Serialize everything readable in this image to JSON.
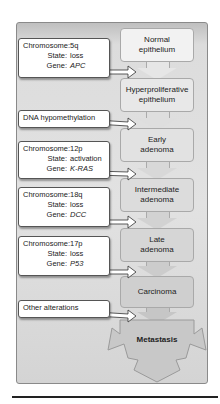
{
  "diagram": {
    "title": "",
    "colors": {
      "stage_light": "#efefef",
      "stage_mid": "#d9d9d9",
      "stage_dark": "#bdbdbd",
      "frame_bg": "#dcdcdc",
      "callout_bg": "#ffffff"
    },
    "stages": [
      {
        "id": "normal",
        "line1": "Normal",
        "line2": "epithelium"
      },
      {
        "id": "hyper",
        "line1": "Hyperproliferative",
        "line2": "epithelium"
      },
      {
        "id": "early",
        "line1": "Early",
        "line2": "adenoma"
      },
      {
        "id": "intermediate",
        "line1": "Intermediate",
        "line2": "adenoma"
      },
      {
        "id": "late",
        "line1": "Late",
        "line2": "adenoma"
      },
      {
        "id": "carcinoma",
        "line1": "Carcinoma",
        "line2": ""
      },
      {
        "id": "metastasis",
        "line1": "Metastasis",
        "line2": ""
      }
    ],
    "labels": {
      "chromosome": "Chromosome:",
      "state": "State:",
      "gene": "Gene:"
    },
    "alterations": [
      {
        "chromosome": "5q",
        "state": "loss",
        "gene": "APC",
        "target": "hyper"
      },
      {
        "text": "DNA hypomethylation",
        "target": "early"
      },
      {
        "chromosome": "12p",
        "state": "activation",
        "gene": "K-RAS",
        "target": "intermediate"
      },
      {
        "chromosome": "18q",
        "state": "loss",
        "gene": "DCC",
        "target": "late"
      },
      {
        "chromosome": "17p",
        "state": "loss",
        "gene": "P53",
        "target": "carcinoma"
      },
      {
        "text": "Other alterations",
        "target": "metastasis"
      }
    ]
  }
}
